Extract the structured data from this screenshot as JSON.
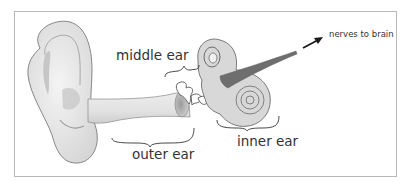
{
  "diagram": {
    "labels": {
      "middle_ear": "middle ear",
      "outer_ear": "outer ear",
      "inner_ear": "inner ear",
      "nerves": "nerves to brain"
    },
    "colors": {
      "frame_border": "#b9b9b9",
      "text": "#333333",
      "ear_fill": "#ececec",
      "ear_shade": "#bdbdbd",
      "outline": "#6b6b6b",
      "nerve": "#6e6e6e",
      "arrow": "#1a1a1a"
    }
  }
}
